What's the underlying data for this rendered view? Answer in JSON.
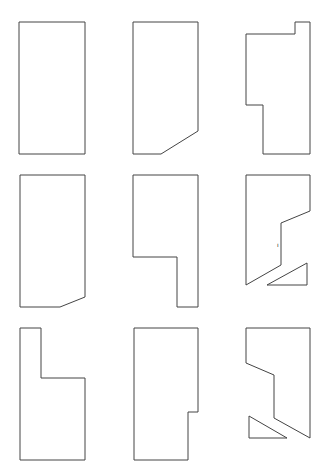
{
  "colors": {
    "background": "#ffffff",
    "stroke": "#444444"
  },
  "shapes": [
    {
      "name": "shape-r1c1-rectangle",
      "points": "19,22 85,22 85,154 19,154"
    },
    {
      "name": "shape-r1c2-beveled-corner",
      "points": "133,22 198,22 198,131 161,154 133,154"
    },
    {
      "name": "shape-r1c3-notched",
      "points": "295,22 310,22 310,154 263,154 263,105 246,105 246,34 295,34"
    },
    {
      "name": "shape-r2c1-beveled-corner",
      "points": "20,175 85,175 85,297 60,307 20,307"
    },
    {
      "name": "shape-r2c2-stepped",
      "points": "133,175 198,175 198,307 177,307 177,257 133,257"
    },
    {
      "name": "shape-r2c3-cut",
      "points": "246,175 310,175 310,211 281,223 281,265 246,285"
    },
    {
      "name": "shape-r2c3-triangle",
      "points": "267,285 307,285 307,263"
    },
    {
      "name": "shape-r3c1-stepped",
      "points": "20,328 41,328 41,378 85,378 85,460 20,460"
    },
    {
      "name": "shape-r3c2-notched",
      "points": "134,328 198,328 198,412 188,412 188,460 134,460"
    },
    {
      "name": "shape-r3c3-cut",
      "points": "246,328 310,328 310,438 274,418 274,375 246,363"
    },
    {
      "name": "shape-r3c3-triangle",
      "points": "249,416 249,438 287,438"
    }
  ],
  "marks": [
    {
      "name": "stray-mark",
      "text": "ı",
      "x": 277,
      "y": 247
    }
  ]
}
